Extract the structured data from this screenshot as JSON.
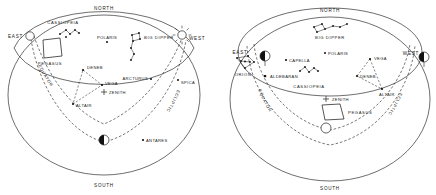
{
  "figure": {
    "panels": [
      {
        "id": "left-panel",
        "name": "evening-sky-panel",
        "cardinals": {
          "north": "NORTH",
          "south": "SOUTH",
          "east": "EAST",
          "west": "WEST"
        },
        "circles": {
          "equator": "EQUATOR",
          "ecliptic": "ECLIPTIC"
        },
        "zenith_label": "ZENITH",
        "constellations": [
          {
            "name": "CASSIOPEIA"
          },
          {
            "name": "BIG DIPPER"
          },
          {
            "name": "PEGASUS"
          }
        ],
        "stars": [
          {
            "name": "POLARIS"
          },
          {
            "name": "DENEB"
          },
          {
            "name": "VEGA"
          },
          {
            "name": "ALTAIR"
          },
          {
            "name": "ARCTURUS"
          },
          {
            "name": "SPICA"
          },
          {
            "name": "ANTARES"
          }
        ],
        "bodies": [
          {
            "name": "sun-east",
            "type": "sun"
          },
          {
            "name": "sun-west",
            "type": "sun-rayed"
          },
          {
            "name": "moon-south",
            "type": "half-moon"
          }
        ]
      },
      {
        "id": "right-panel",
        "name": "morning-sky-panel",
        "cardinals": {
          "north": "NORTH",
          "south": "SOUTH",
          "east": "EAST",
          "west": "WEST"
        },
        "circles": {
          "equator": "EQUATOR",
          "ecliptic": "ECLIPTIC"
        },
        "zenith_label": "ZENITH",
        "constellations": [
          {
            "name": "BIG DIPPER"
          },
          {
            "name": "ORION"
          },
          {
            "name": "CASSIOPEIA"
          },
          {
            "name": "PEGASUS"
          }
        ],
        "stars": [
          {
            "name": "CAPELLA"
          },
          {
            "name": "ALDEBARAN"
          },
          {
            "name": "POLARIS"
          },
          {
            "name": "VEGA"
          },
          {
            "name": "DENEB"
          },
          {
            "name": "ALTAIR"
          }
        ],
        "bodies": [
          {
            "name": "moon-east",
            "type": "half-moon"
          },
          {
            "name": "moon-west",
            "type": "half-moon"
          },
          {
            "name": "sun-south",
            "type": "sun"
          }
        ]
      }
    ]
  }
}
